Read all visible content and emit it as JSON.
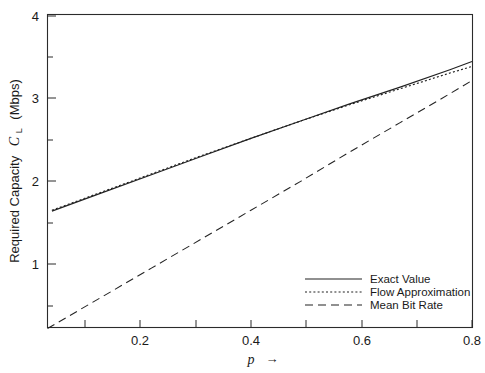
{
  "chart_data": {
    "type": "line",
    "title": "",
    "xlabel": "p →",
    "xlabel_symbol": "p",
    "xlabel_arrow": "→",
    "ylabel": "Required Capacity  C_L  (Mbps)",
    "ylabel_prefix": "Required Capacity",
    "ylabel_symbol": "C",
    "ylabel_subscript": "L",
    "ylabel_units": "(Mbps)",
    "xlim": [
      0.032,
      0.8
    ],
    "ylim": [
      0.0,
      4.0
    ],
    "grid": false,
    "xticks": [
      0.1,
      0.2,
      0.3,
      0.4,
      0.5,
      0.6,
      0.7,
      0.8
    ],
    "xticklabels": [
      "",
      "0.2",
      "",
      "0.4",
      "",
      "0.6",
      "",
      "0.8"
    ],
    "xticklabels_shown": [
      "0.2",
      "0.4",
      "0.6",
      "0.8"
    ],
    "yticks": [
      0.5,
      1.0,
      1.5,
      2.0,
      2.5,
      3.0,
      3.5,
      4.0
    ],
    "yticklabels": [
      "",
      "1",
      "",
      "2",
      "",
      "3",
      "",
      "4"
    ],
    "yticklabels_shown": [
      "1",
      "2",
      "3",
      "4"
    ],
    "legend_position": "lower right",
    "series": [
      {
        "name": "Exact Value",
        "style": "solid",
        "color": "#222222",
        "x": [
          0.04,
          0.13,
          0.22,
          0.31,
          0.4,
          0.49,
          0.58,
          0.67,
          0.76,
          0.8
        ],
        "y": [
          1.64,
          1.86,
          2.08,
          2.3,
          2.52,
          2.73,
          2.94,
          3.14,
          3.35,
          3.45
        ]
      },
      {
        "name": "Flow Approximation",
        "style": "dotted",
        "color": "#222222",
        "x": [
          0.04,
          0.13,
          0.22,
          0.31,
          0.4,
          0.49,
          0.58,
          0.67,
          0.76,
          0.8
        ],
        "y": [
          1.65,
          1.87,
          2.09,
          2.31,
          2.52,
          2.73,
          2.93,
          3.12,
          3.31,
          3.39
        ]
      },
      {
        "name": "Mean Bit Rate",
        "style": "dashed",
        "color": "#222222",
        "x": [
          0.032,
          0.13,
          0.22,
          0.31,
          0.4,
          0.49,
          0.58,
          0.67,
          0.76,
          0.8
        ],
        "y": [
          0.22,
          0.6,
          0.95,
          1.3,
          1.65,
          2.0,
          2.36,
          2.71,
          3.06,
          3.22
        ]
      }
    ]
  },
  "legend": {
    "items": [
      {
        "label": "Exact Value",
        "style": "solid"
      },
      {
        "label": "Flow Approximation",
        "style": "dotted"
      },
      {
        "label": "Mean Bit Rate",
        "style": "dashed"
      }
    ]
  },
  "axes": {
    "y_tick_labels": [
      {
        "value": "4",
        "y": 16
      },
      {
        "value": "3",
        "y": 98
      },
      {
        "value": "2",
        "y": 181
      },
      {
        "value": "1",
        "y": 264
      }
    ],
    "x_tick_labels": [
      {
        "value": "0.2",
        "x": 140
      },
      {
        "value": "0.4",
        "x": 251
      },
      {
        "value": "0.6",
        "x": 362
      },
      {
        "value": "0.8",
        "x": 472
      }
    ]
  },
  "colors": {
    "background": "#ffffff",
    "ink": "#1a1a1a",
    "axis": "#2b2b2b",
    "series": "#222222"
  }
}
